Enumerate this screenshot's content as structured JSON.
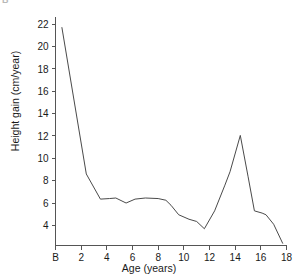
{
  "panel": {
    "label": "B"
  },
  "chart_data": {
    "type": "line",
    "title": "",
    "xlabel": "Age (years)",
    "ylabel": "Height gain (cm/year)",
    "xlim": [
      0,
      18
    ],
    "ylim": [
      2.2,
      22.6
    ],
    "grid": false,
    "legend": "none",
    "xticks": [
      0,
      2,
      4,
      6,
      8,
      10,
      12,
      14,
      16,
      18
    ],
    "xticklabels": [
      "B",
      "2",
      "4",
      "6",
      "8",
      "10",
      "12",
      "14",
      "16",
      "18"
    ],
    "yticks": [
      4,
      6,
      8,
      10,
      12,
      14,
      16,
      18,
      20,
      22
    ],
    "yticklabels": [
      "4",
      "6",
      "8",
      "10",
      "12",
      "14",
      "16",
      "18",
      "20",
      "22"
    ],
    "series": [
      {
        "name": "Height velocity",
        "x": [
          0.5,
          2.4,
          3.5,
          4.2,
          4.7,
          5.5,
          6.2,
          7.0,
          8.0,
          8.6,
          9.0,
          9.6,
          10.4,
          11.0,
          11.6,
          12.4,
          13.2,
          13.6,
          14.4,
          15.0,
          15.5,
          16.1,
          16.4,
          17.0,
          17.7
        ],
        "values": [
          21.7,
          8.6,
          6.35,
          6.4,
          6.45,
          6.0,
          6.35,
          6.45,
          6.4,
          6.25,
          5.8,
          4.95,
          4.55,
          4.35,
          3.7,
          5.3,
          7.6,
          8.8,
          12.05,
          8.4,
          5.3,
          5.1,
          4.95,
          4.1,
          2.4
        ]
      }
    ]
  }
}
